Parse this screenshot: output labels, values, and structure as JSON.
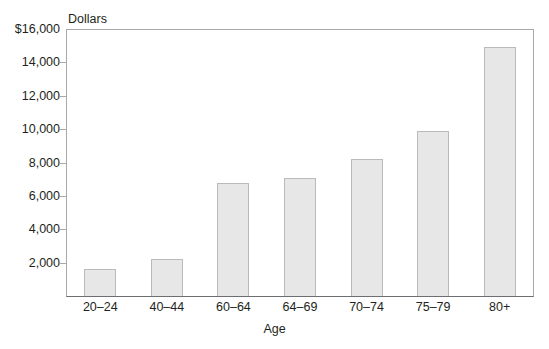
{
  "chart_data": {
    "type": "bar",
    "title": "",
    "subtitle": "",
    "categories": [
      "20–24",
      "40–44",
      "60–64",
      "64–69",
      "70–74",
      "75–79",
      "80+"
    ],
    "values": [
      1600,
      2200,
      6800,
      7100,
      8200,
      9900,
      14900
    ],
    "series": [
      {
        "name": "Dollars",
        "values": [
          1600,
          2200,
          6800,
          7100,
          8200,
          9900,
          14900
        ]
      }
    ],
    "xlabel": "Age",
    "ylabel": "Dollars",
    "ylim": [
      0,
      16000
    ],
    "ytick_values": [
      0,
      2000,
      4000,
      6000,
      8000,
      10000,
      12000,
      14000,
      16000
    ],
    "ytick_labels": [
      "",
      "2,000",
      "4,000",
      "6,000",
      "8,000",
      "10,000",
      "12,000",
      "14,000",
      "$16,000"
    ],
    "grid": false,
    "legend": null,
    "legend_position": "none",
    "bar_fill_color": "#e7e7e7",
    "bar_border_color": "#b9babc",
    "axis_color": "#a7a9ac",
    "text_color": "#231f20",
    "background_color": "#ffffff"
  },
  "axes": {
    "y_axis_unit_label": "Dollars",
    "x_axis_title": "Age"
  }
}
